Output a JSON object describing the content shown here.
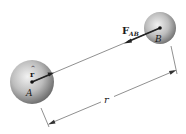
{
  "diagram": {
    "type": "physics-two-body-force",
    "bodies": [
      {
        "id": "A",
        "label": "A",
        "cx": 32,
        "cy": 82,
        "r": 22
      },
      {
        "id": "B",
        "label": "B",
        "cx": 160,
        "cy": 28,
        "r": 16
      }
    ],
    "labels": {
      "force_main": "F",
      "force_sub": "AB",
      "unit_vector": "r",
      "unit_vector_hat": "^",
      "distance": "r",
      "body_a": "A",
      "body_b": "B"
    },
    "colors": {
      "sphere_light": "#f0f0f0",
      "sphere_mid": "#b8b8b8",
      "sphere_dark": "#6e6e6e",
      "line": "#333333",
      "text": "#1a1a1a"
    }
  }
}
